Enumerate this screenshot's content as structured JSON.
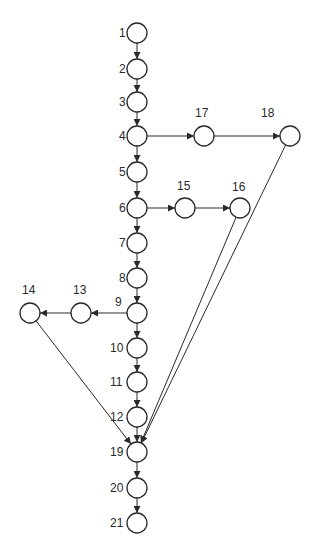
{
  "diagram": {
    "type": "directed-graph",
    "node_radius": 10,
    "stroke_color": "#2a2a2a",
    "background": "#ffffff",
    "nodes": [
      {
        "id": "1",
        "label": "1",
        "x": 137,
        "y": 33,
        "lx": 119,
        "ly": 37
      },
      {
        "id": "2",
        "label": "2",
        "x": 137,
        "y": 69,
        "lx": 119,
        "ly": 73
      },
      {
        "id": "3",
        "label": "3",
        "x": 137,
        "y": 102,
        "lx": 119,
        "ly": 106
      },
      {
        "id": "4",
        "label": "4",
        "x": 137,
        "y": 136,
        "lx": 119,
        "ly": 140
      },
      {
        "id": "5",
        "label": "5",
        "x": 137,
        "y": 172,
        "lx": 119,
        "ly": 176
      },
      {
        "id": "6",
        "label": "6",
        "x": 137,
        "y": 208,
        "lx": 119,
        "ly": 212
      },
      {
        "id": "7",
        "label": "7",
        "x": 137,
        "y": 243,
        "lx": 119,
        "ly": 247
      },
      {
        "id": "8",
        "label": "8",
        "x": 137,
        "y": 278,
        "lx": 119,
        "ly": 282
      },
      {
        "id": "9",
        "label": "9",
        "x": 137,
        "y": 313,
        "lx": 115,
        "ly": 306
      },
      {
        "id": "10",
        "label": "10",
        "x": 137,
        "y": 348,
        "lx": 110,
        "ly": 352
      },
      {
        "id": "11",
        "label": "11",
        "x": 137,
        "y": 382,
        "lx": 110,
        "ly": 386
      },
      {
        "id": "12",
        "label": "12",
        "x": 137,
        "y": 417,
        "lx": 110,
        "ly": 421
      },
      {
        "id": "13",
        "label": "13",
        "x": 81,
        "y": 313,
        "lx": 73,
        "ly": 294
      },
      {
        "id": "14",
        "label": "14",
        "x": 30,
        "y": 313,
        "lx": 22,
        "ly": 294
      },
      {
        "id": "15",
        "label": "15",
        "x": 185,
        "y": 208,
        "lx": 177,
        "ly": 190
      },
      {
        "id": "16",
        "label": "16",
        "x": 240,
        "y": 208,
        "lx": 232,
        "ly": 191
      },
      {
        "id": "17",
        "label": "17",
        "x": 204,
        "y": 136,
        "lx": 195,
        "ly": 117
      },
      {
        "id": "18",
        "label": "18",
        "x": 290,
        "y": 136,
        "lx": 261,
        "ly": 117
      },
      {
        "id": "19",
        "label": "19",
        "x": 137,
        "y": 452,
        "lx": 110,
        "ly": 456
      },
      {
        "id": "20",
        "label": "20",
        "x": 137,
        "y": 488,
        "lx": 110,
        "ly": 492
      },
      {
        "id": "21",
        "label": "21",
        "x": 137,
        "y": 523,
        "lx": 110,
        "ly": 527
      }
    ],
    "edges": [
      {
        "from": "1",
        "to": "2"
      },
      {
        "from": "2",
        "to": "3"
      },
      {
        "from": "3",
        "to": "4"
      },
      {
        "from": "4",
        "to": "5"
      },
      {
        "from": "4",
        "to": "17"
      },
      {
        "from": "17",
        "to": "18"
      },
      {
        "from": "5",
        "to": "6"
      },
      {
        "from": "6",
        "to": "7"
      },
      {
        "from": "6",
        "to": "15"
      },
      {
        "from": "15",
        "to": "16"
      },
      {
        "from": "7",
        "to": "8"
      },
      {
        "from": "8",
        "to": "9"
      },
      {
        "from": "9",
        "to": "10"
      },
      {
        "from": "9",
        "to": "13"
      },
      {
        "from": "13",
        "to": "14"
      },
      {
        "from": "10",
        "to": "11"
      },
      {
        "from": "11",
        "to": "12"
      },
      {
        "from": "12",
        "to": "19"
      },
      {
        "from": "14",
        "to": "19"
      },
      {
        "from": "16",
        "to": "19"
      },
      {
        "from": "18",
        "to": "19"
      },
      {
        "from": "19",
        "to": "20"
      },
      {
        "from": "20",
        "to": "21"
      }
    ]
  }
}
